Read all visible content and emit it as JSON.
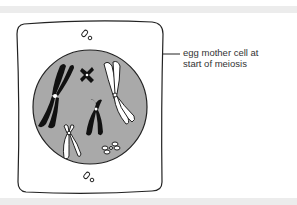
{
  "diagram": {
    "label": {
      "line1": "egg mother cell at",
      "line2": "start of meiosis"
    },
    "colors": {
      "nucleus_fill": "#a9a9a9",
      "outline": "#222222",
      "chromosome_dark": "#111111",
      "chromosome_light": "#ffffff",
      "band": "#ececec"
    },
    "elements": [
      "cell-membrane",
      "nucleus",
      "centriole-top",
      "centriole-bottom",
      "chromosome-large-dark",
      "chromosome-small-dark",
      "chromosome-medium-dark",
      "chromosome-large-light",
      "chromosome-medium-light",
      "chromosome-small-light"
    ]
  }
}
